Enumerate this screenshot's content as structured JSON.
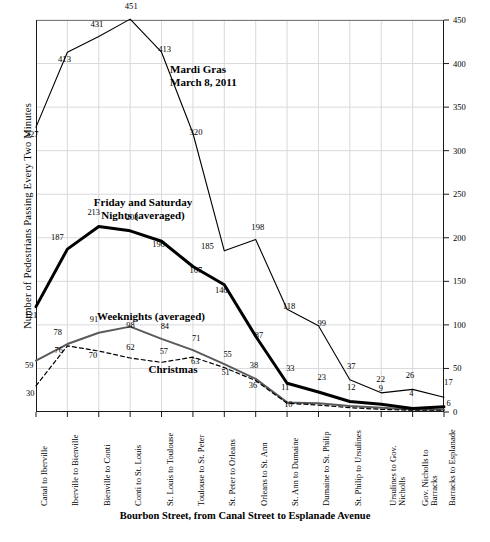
{
  "chart_data": {
    "type": "line",
    "title": "",
    "xlabel": "Bourbon Street, from Canal Street to Esplanade Avenue",
    "ylabel": "Number of Pedestrians Passing Every Two Minutes",
    "ylim": [
      0,
      450
    ],
    "yticks": [
      0,
      50,
      100,
      150,
      200,
      250,
      300,
      350,
      400,
      450
    ],
    "grid": true,
    "legend_position": "inline-annotations",
    "categories": [
      "Canal to Iberville",
      "Iberville to Bienville",
      "Bienville to Conti",
      "Conti to St. Louis",
      "St. Louis to Toulouse",
      "Toulouse to St. Peter",
      "St. Peter to Orleans",
      "Orleans to St. Ann",
      "St. Ann to Dumaine",
      "Dumaine to St. Philip",
      "St. Philip to Ursulines",
      "Ursulines to Gov.\nNicholls",
      "Gov. Nicholls to\nBarracks",
      "Barracks to Esplanade"
    ],
    "series": [
      {
        "name": "Mardi Gras March 8, 2011",
        "style": "thin-solid-black",
        "values": [
          327,
          413,
          431,
          451,
          413,
          320,
          185,
          198,
          118,
          99,
          37,
          22,
          26,
          17
        ]
      },
      {
        "name": "Friday and Saturday Nights (averaged)",
        "style": "thick-solid-black",
        "values": [
          121,
          187,
          213,
          208,
          196,
          167,
          146,
          87,
          33,
          23,
          12,
          9,
          4,
          6
        ]
      },
      {
        "name": "Weeknights (averaged)",
        "style": "medium-solid-gray",
        "values": [
          59,
          78,
          91,
          98,
          84,
          71,
          55,
          38,
          11,
          10,
          7,
          5,
          3,
          3
        ]
      },
      {
        "name": "Christmas",
        "style": "dashed-black",
        "values": [
          30,
          76,
          70,
          62,
          57,
          63,
          51,
          36,
          10,
          8,
          5,
          3,
          2,
          2
        ]
      }
    ],
    "annotations": [
      {
        "id": "mardi-gras",
        "text": "Mardi Gras\nMarch 8, 2011"
      },
      {
        "id": "friday-saturday",
        "text": "Friday and Saturday\nNights (averaged)"
      },
      {
        "id": "weeknights",
        "text": "Weeknights (averaged)"
      },
      {
        "id": "christmas",
        "text": "Christmas"
      }
    ],
    "point_labels": {
      "mardi_gras": [
        "327",
        "413",
        "431",
        "451",
        "413",
        "320",
        "185",
        "198",
        "118",
        "99",
        "37",
        "22",
        "26",
        "17"
      ],
      "friday_saturday": [
        "121",
        "187",
        "213",
        "208",
        "196",
        "167",
        "146",
        "87",
        "33",
        "23",
        "12",
        "9",
        "4",
        "6"
      ],
      "weeknights": [
        "59",
        "78",
        "91",
        "98",
        "84",
        "71",
        "55",
        "38",
        "11",
        "",
        "",
        "",
        "",
        ""
      ],
      "christmas": [
        "30",
        "76",
        "70",
        "62",
        "57",
        "63",
        "51",
        "36",
        "10",
        "",
        "",
        "",
        "",
        ""
      ]
    },
    "colors": {
      "axis": "#1a1a1a",
      "grid": "#d9d9dd",
      "mardi_gras": "#000000",
      "friday_saturday": "#000000",
      "weeknights": "#5a5a5a",
      "christmas": "#000000"
    }
  }
}
